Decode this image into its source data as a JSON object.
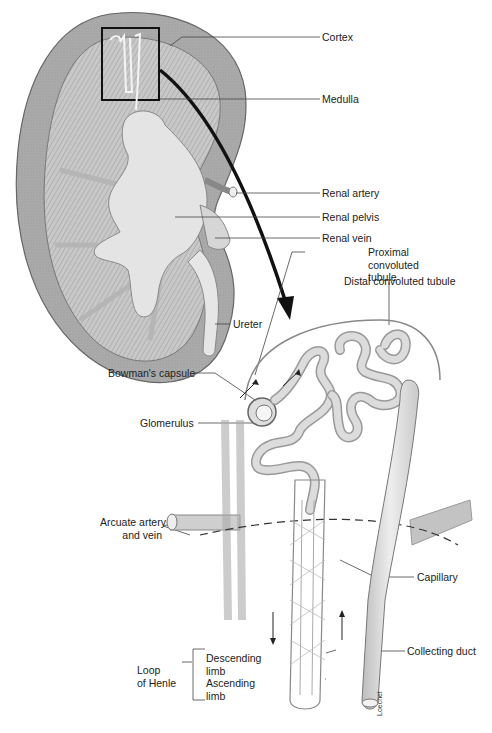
{
  "diagram": {
    "type": "anatomical illustration",
    "colors": {
      "cortex": "#a9a9a9",
      "medulla": "#c4c4c4",
      "pelvis": "#e3e3e3",
      "tubule": "#d9d9d9",
      "line": "#333333",
      "arrow": "#111111"
    }
  },
  "labels": {
    "cortex": "Cortex",
    "medulla": "Medulla",
    "renal_artery": "Renal artery",
    "renal_pelvis": "Renal pelvis",
    "renal_vein": "Renal vein",
    "ureter": "Ureter",
    "proximal_tubule": [
      "Proximal",
      "convoluted",
      "tubule"
    ],
    "distal_tubule": "Distal convoluted tubule",
    "bowmans_capsule": "Bowman's capsule",
    "glomerulus": "Glomerulus",
    "arcuate": [
      "Arcuate artery",
      "and vein"
    ],
    "capillary": "Capillary",
    "collecting_duct": "Collecting duct",
    "loop_of_henle": [
      "Loop",
      "of Henle"
    ],
    "descending_limb": [
      "Descending",
      "limb"
    ],
    "ascending_limb": [
      "Ascending",
      "limb"
    ]
  },
  "signature": "Loechel"
}
